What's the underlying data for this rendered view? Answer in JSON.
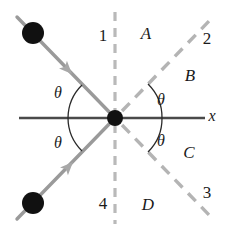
{
  "figure": {
    "background": "#ffffff",
    "width": 228,
    "height": 235
  },
  "colors": {
    "axis": "#4a4a4a",
    "ray": "#9a9a9a",
    "dashed": "#b4b4b4",
    "dot": "#111111",
    "arc": "#2a2a2a",
    "text": "#1a1a1a"
  },
  "axis": {
    "x_label": "x",
    "x_label_pos": {
      "x": 212,
      "y": 116
    }
  },
  "origin": {
    "x": 115,
    "y": 118
  },
  "rays": [
    {
      "name": "incoming-upper-left-ray",
      "style": "solid",
      "color": "#9a9a9a",
      "from": {
        "x": 18,
        "y": 18
      },
      "to": {
        "x": 115,
        "y": 118
      },
      "arrow_at": {
        "x": 68,
        "y": 70
      },
      "dot_at": {
        "x": 33,
        "y": 33
      }
    },
    {
      "name": "incoming-lower-left-ray",
      "style": "solid",
      "color": "#9a9a9a",
      "from": {
        "x": 18,
        "y": 218
      },
      "to": {
        "x": 115,
        "y": 118
      },
      "arrow_at": {
        "x": 70,
        "y": 168
      },
      "dot_at": {
        "x": 33,
        "y": 203
      }
    },
    {
      "name": "dashed-ray-upper-right",
      "style": "dashed",
      "color": "#b4b4b4",
      "from": {
        "x": 115,
        "y": 118
      },
      "to": {
        "x": 212,
        "y": 18
      }
    },
    {
      "name": "dashed-ray-lower-right",
      "style": "dashed",
      "color": "#b4b4b4",
      "from": {
        "x": 115,
        "y": 118
      },
      "to": {
        "x": 212,
        "y": 218
      }
    },
    {
      "name": "dashed-vertical-normal",
      "style": "dashed",
      "color": "#b4b4b4",
      "from": {
        "x": 115,
        "y": 12
      },
      "to": {
        "x": 115,
        "y": 224
      }
    }
  ],
  "labels": {
    "quadrants": [
      {
        "text": "1",
        "x": 103,
        "y": 35
      },
      {
        "text": "2",
        "x": 207,
        "y": 38
      },
      {
        "text": "3",
        "x": 207,
        "y": 192
      },
      {
        "text": "4",
        "x": 103,
        "y": 203
      }
    ],
    "regions": [
      {
        "text": "A",
        "x": 146,
        "y": 33
      },
      {
        "text": "B",
        "x": 190,
        "y": 75
      },
      {
        "text": "C",
        "x": 189,
        "y": 152
      },
      {
        "text": "D",
        "x": 148,
        "y": 204
      }
    ],
    "angles": [
      {
        "text": "θ",
        "name": "theta-upper-left",
        "x": 58,
        "y": 93
      },
      {
        "text": "θ",
        "name": "theta-upper-right",
        "x": 161,
        "y": 100
      },
      {
        "text": "θ",
        "name": "theta-lower-left",
        "x": 58,
        "y": 143
      },
      {
        "text": "θ",
        "name": "theta-lower-right",
        "x": 161,
        "y": 141
      }
    ]
  }
}
